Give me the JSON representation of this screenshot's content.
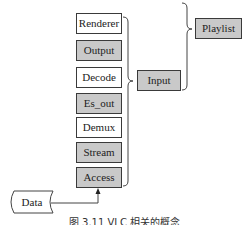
{
  "diagram": {
    "modules": [
      {
        "label": "Renderer",
        "style": "white"
      },
      {
        "label": "Output",
        "style": "gray"
      },
      {
        "label": "Decode",
        "style": "white"
      },
      {
        "label": "Es_out",
        "style": "gray"
      },
      {
        "label": "Demux",
        "style": "white"
      },
      {
        "label": "Stream",
        "style": "gray"
      },
      {
        "label": "Access",
        "style": "gray"
      }
    ],
    "input": {
      "label": "Input"
    },
    "playlist": {
      "label": "Playlist"
    },
    "data": {
      "label": "Data"
    },
    "caption": "图 3.11  VLC 相关的概念",
    "colors": {
      "gray_fill": "#c9c9c9",
      "border": "#3a3a3a",
      "white_fill": "#ffffff"
    }
  }
}
